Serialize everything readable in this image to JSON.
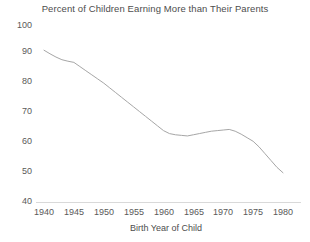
{
  "chart_data": {
    "type": "line",
    "title": "Percent of Children Earning More than Their Parents",
    "xlabel": "Birth Year of Child",
    "ylabel": "",
    "xlim": [
      1938,
      1982
    ],
    "ylim": [
      40,
      100
    ],
    "grid": false,
    "legend": "none",
    "line_color": "#a6a6a6",
    "x_ticks": [
      "1940",
      "1945",
      "1950",
      "1955",
      "1960",
      "1965",
      "1970",
      "1975",
      "1980"
    ],
    "y_ticks": [
      "40",
      "50",
      "60",
      "70",
      "80",
      "90",
      "100"
    ],
    "series": [
      {
        "name": "Percent of Children Earning More than Their Parents",
        "x": [
          1940,
          1941,
          1942,
          1943,
          1944,
          1945,
          1946,
          1947,
          1948,
          1949,
          1950,
          1951,
          1952,
          1953,
          1954,
          1955,
          1956,
          1957,
          1958,
          1959,
          1960,
          1961,
          1962,
          1963,
          1964,
          1965,
          1966,
          1967,
          1968,
          1969,
          1970,
          1971,
          1972,
          1973,
          1974,
          1975,
          1976,
          1977,
          1978,
          1979,
          1980
        ],
        "values": [
          91.5,
          90.3,
          89.2,
          88.3,
          87.8,
          87.4,
          86.0,
          84.6,
          83.2,
          81.8,
          80.4,
          78.8,
          77.2,
          75.6,
          74.0,
          72.4,
          70.8,
          69.2,
          67.6,
          66.0,
          64.4,
          63.4,
          63.0,
          62.8,
          62.6,
          63.0,
          63.4,
          63.8,
          64.2,
          64.4,
          64.6,
          64.8,
          64.2,
          63.2,
          62.0,
          60.8,
          58.9,
          56.6,
          54.3,
          52.0,
          50.2
        ]
      }
    ]
  }
}
